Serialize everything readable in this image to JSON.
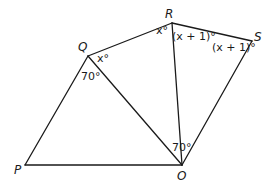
{
  "diagram": {
    "points": {
      "P": {
        "label": "P",
        "x": 25,
        "y": 165
      },
      "O": {
        "label": "O",
        "x": 182,
        "y": 165
      },
      "Q": {
        "label": "Q",
        "x": 88,
        "y": 56
      },
      "R": {
        "label": "R",
        "x": 172,
        "y": 23
      },
      "S": {
        "label": "S",
        "x": 252,
        "y": 41
      }
    },
    "segments": [
      [
        "P",
        "O"
      ],
      [
        "P",
        "Q"
      ],
      [
        "Q",
        "O"
      ],
      [
        "Q",
        "R"
      ],
      [
        "R",
        "O"
      ],
      [
        "R",
        "S"
      ],
      [
        "S",
        "O"
      ]
    ],
    "angles": {
      "Q_RQO": "x°",
      "R_QRO": "x°",
      "R_ORS": "(x + 1)°",
      "S_RSO": "(x + 1)°",
      "Q_PQO": "70°",
      "O_ROS": "70°"
    },
    "angle_parts": {
      "x": "x",
      "deg": "°",
      "open": "(",
      "plus1": " + 1)"
    }
  }
}
